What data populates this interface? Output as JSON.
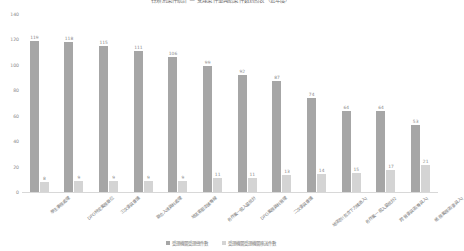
{
  "chart_data": {
    "type": "bar",
    "title": "各類別案件統計 — 受理案件量與結案件數對照表（近年度）",
    "xlabel": "",
    "ylabel": "",
    "ylim": [
      0,
      140
    ],
    "yticks": [
      0,
      20,
      40,
      60,
      80,
      100,
      120,
      140
    ],
    "grid": false,
    "legend_position": "bottom",
    "categories": [
      "學生事務處理",
      "DPO特定業務單位",
      "三次委員會議",
      "聯合入境資料處理",
      "地區客服支援專線",
      "各作業一般入量統計",
      "DPO業務資料管理",
      "二次委員會議",
      "地區別(包含下方構造入)",
      "各作業一般入量統計2",
      "跨管委員區(專員入)",
      "帳務業務區(委員入)"
    ],
    "series": [
      {
        "name": "受理機關受理總件數",
        "color": "#a6a6a6",
        "values": [
          119,
          118,
          115,
          111,
          106,
          99,
          92,
          87,
          74,
          64,
          64,
          53
        ]
      },
      {
        "name": "受理機關受理機關移送件數",
        "color": "#d4d4d4",
        "values": [
          8,
          9,
          9,
          9,
          9,
          11,
          11,
          13,
          14,
          15,
          17,
          21
        ]
      }
    ]
  }
}
